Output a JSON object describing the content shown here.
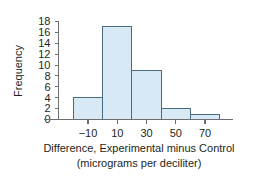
{
  "chart_data": {
    "type": "bar",
    "title": "",
    "subtitle": "",
    "xlabel": "Difference, Experimental minus Control",
    "xlabel_line2": "(micrograms per deciliter)",
    "ylabel": "Frequency",
    "categories": [
      "-20 to 0",
      "0 to 20",
      "20 to 40",
      "40 to 60",
      "60 to 80"
    ],
    "bin_edges": [
      -20,
      0,
      20,
      40,
      60,
      80
    ],
    "values": [
      4,
      17,
      9,
      2,
      1
    ],
    "xlim": [
      -30,
      90
    ],
    "ylim": [
      0,
      18
    ],
    "xticks": [
      -10,
      10,
      30,
      50,
      70
    ],
    "xtick_labels": [
      "−10",
      "10",
      "30",
      "50",
      "70"
    ],
    "yticks": [
      0,
      2,
      4,
      6,
      8,
      10,
      12,
      14,
      16,
      18
    ],
    "ytick_labels": [
      "0",
      "2",
      "4",
      "6",
      "8",
      "10",
      "12",
      "14",
      "16",
      "18"
    ],
    "grid": false,
    "legend": null,
    "legend_position": "none",
    "bar_fill_color": "#d6e9f4",
    "bar_edge_color": "#4a6b80",
    "axis_color": "#6d6e71",
    "text_color": "#231f20"
  }
}
